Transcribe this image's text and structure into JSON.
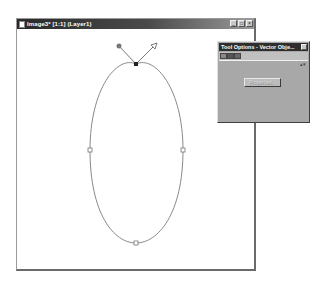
{
  "image_window": {
    "title": "Image3* [1:1] (Layer1)",
    "buttons": {
      "minimize": "_",
      "maximize": "□",
      "close": "×"
    }
  },
  "canvas": {
    "shape": "ellipse",
    "nodes": [
      {
        "name": "top",
        "x": 119,
        "y": 35
      },
      {
        "name": "left",
        "x": 73,
        "y": 121
      },
      {
        "name": "right",
        "x": 166,
        "y": 121
      },
      {
        "name": "bottom",
        "x": 119,
        "y": 214
      }
    ],
    "control_handles": [
      {
        "name": "left-handle",
        "x": 102,
        "y": 17,
        "style": "filled-circle"
      },
      {
        "name": "right-handle",
        "x": 137,
        "y": 17,
        "style": "arrow"
      }
    ],
    "colors": {
      "stroke": "#888888",
      "node": "#777777",
      "selected_node": "#222222"
    }
  },
  "tool_options": {
    "title": "Tool Options - Vector Obje...",
    "close": "×",
    "properties_button": "Properties...",
    "properties_enabled": false
  }
}
